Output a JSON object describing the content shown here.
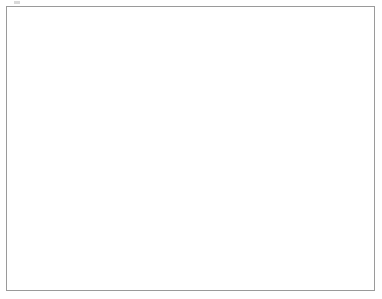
{
  "figure": {
    "background_color": "#ffffff",
    "frame_color": "#9a9a9a",
    "artifact_name": "scan-artifact"
  },
  "chart_data": {
    "type": "line",
    "title": "",
    "subtitle": "",
    "xlabel": "Pre-test Total Score",
    "ylabel": "Gain in Score",
    "xlim": [
      0,
      40
    ],
    "ylim": [
      -6.5,
      15.5
    ],
    "xticks": [
      0,
      10,
      20,
      30,
      40
    ],
    "xtick_labels": [
      "0",
      "10",
      "20",
      "30",
      "40"
    ],
    "yticks": [
      -5,
      0,
      5,
      10,
      15
    ],
    "ytick_labels": [
      "-5",
      "0",
      "5",
      "10",
      "15"
    ],
    "grid": false,
    "legend": null,
    "legend_position": "none",
    "annotations": [],
    "series": [
      {
        "name": "Overall fitted regression line",
        "role": "primary-fit",
        "color": "#111111",
        "line_width": 2.1,
        "x": [
          0,
          40
        ],
        "values": [
          7.0,
          -0.4
        ],
        "slope": -0.185,
        "intercept": 7.0
      },
      {
        "name": "Individual school regression lines",
        "role": "spaghetti-band",
        "color": "#e2e2e2",
        "line_width": 0.5,
        "count": 420,
        "x": [
          0,
          40
        ],
        "intercept_range": [
          -0.5,
          15.2
        ],
        "slope_range": [
          -0.3,
          -0.09
        ],
        "band_left_values": [
          -0.5,
          15.2
        ],
        "band_right_values": [
          -6.1,
          8.2
        ]
      }
    ],
    "plot_area_px": {
      "left": 48,
      "top": 13,
      "right": 362,
      "bottom": 255
    }
  }
}
